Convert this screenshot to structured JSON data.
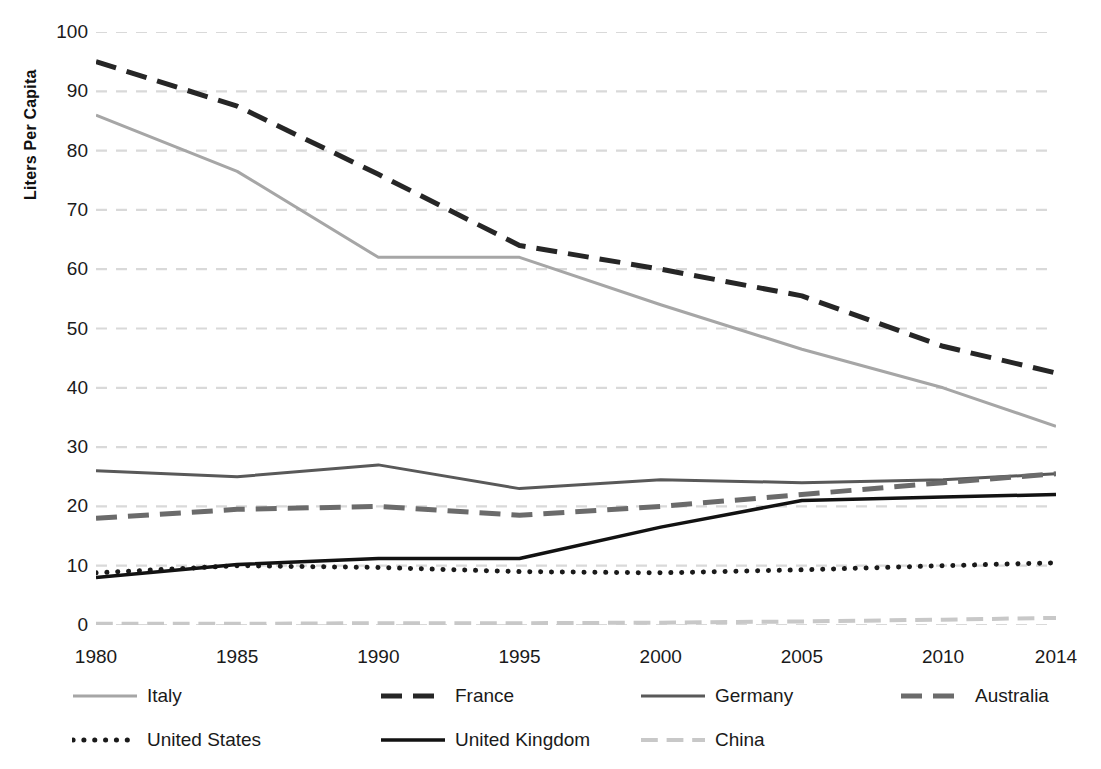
{
  "chart_data": {
    "type": "line",
    "title": "",
    "xlabel": "",
    "ylabel": "Liters Per Capita",
    "x": [
      1980,
      1985,
      1990,
      1995,
      2000,
      2005,
      2010,
      2014
    ],
    "xtick_labels": [
      "1980",
      "1985",
      "1990",
      "1995",
      "2000",
      "2005",
      "2010",
      "2014"
    ],
    "ytick_labels": [
      "0",
      "10",
      "20",
      "30",
      "40",
      "50",
      "60",
      "70",
      "80",
      "90",
      "100"
    ],
    "yticks": [
      0,
      10,
      20,
      30,
      40,
      50,
      60,
      70,
      80,
      90,
      100
    ],
    "ylim": [
      0,
      100
    ],
    "xlim": [
      1980,
      2014
    ],
    "grid": "horizontal-dashed",
    "legend_position": "bottom",
    "series": [
      {
        "name": "Italy",
        "color": "#a6a6a6",
        "style": "solid",
        "width": 3,
        "values": [
          86,
          76.5,
          62,
          62,
          54,
          46.5,
          40,
          33.5
        ]
      },
      {
        "name": "France",
        "color": "#262626",
        "style": "dashed",
        "width": 5,
        "values": [
          95,
          87.5,
          76,
          64,
          60,
          55.5,
          47,
          42.5
        ]
      },
      {
        "name": "Germany",
        "color": "#595959",
        "style": "solid",
        "width": 3,
        "values": [
          26,
          25,
          27,
          23,
          24.5,
          24,
          24.5,
          25.5
        ]
      },
      {
        "name": "Australia",
        "color": "#6b6b6b",
        "style": "dashed",
        "width": 5,
        "values": [
          18,
          19.5,
          20,
          18.5,
          20,
          22,
          24,
          25.5
        ]
      },
      {
        "name": "United States",
        "color": "#1a1a1a",
        "style": "dotted",
        "width": 5,
        "values": [
          8.8,
          10,
          9.7,
          9,
          8.8,
          9.3,
          10,
          10.5
        ]
      },
      {
        "name": "United Kingdom",
        "color": "#121212",
        "style": "solid",
        "width": 3.5,
        "values": [
          8,
          10.2,
          11.2,
          11.2,
          16.5,
          21,
          21.6,
          22
        ]
      },
      {
        "name": "China",
        "color": "#c8c8c8",
        "style": "dashed",
        "width": 4,
        "values": [
          0.2,
          0.2,
          0.3,
          0.3,
          0.4,
          0.6,
          0.9,
          1.2
        ]
      }
    ]
  },
  "axis": {
    "y_title": "Liters Per Capita"
  },
  "legend": {
    "rows": [
      [
        {
          "label": "Italy",
          "key": "Italy"
        },
        {
          "label": "France",
          "key": "France"
        },
        {
          "label": "Germany",
          "key": "Germany"
        },
        {
          "label": "Australia",
          "key": "Australia"
        }
      ],
      [
        {
          "label": "United States",
          "key": "United States"
        },
        {
          "label": "United Kingdom",
          "key": "United Kingdom"
        },
        {
          "label": "China",
          "key": "China"
        }
      ]
    ]
  },
  "colors": {
    "gridline": "#d9d9d9",
    "background": "#ffffff",
    "text": "#1a1a1a"
  }
}
